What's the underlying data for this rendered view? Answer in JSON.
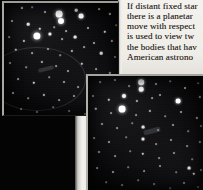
{
  "page": {
    "width": 203,
    "height": 190,
    "background_color": "#000000",
    "paper_color": "#f2f0ec",
    "ink_color": "#2b2722"
  },
  "body_text": {
    "lines": [
      "If distant fixed star",
      "there is a planetar",
      "move with respect",
      "is used to view tw",
      "the bodies that hav",
      "American astrono"
    ],
    "line_1": "If distant fixed star",
    "line_2": "there is a planetar",
    "line_3": "move with respect",
    "line_4": "is used to view tw",
    "line_5": "the bodies that hav",
    "line_6": "American astrono"
  },
  "figures": {
    "top_photo": {
      "name": "star-field-photograph-upper",
      "caption": "",
      "border_color": "#a9a7a2",
      "sky_color": "#050506",
      "star_color": "#ffffff",
      "stars": [
        {
          "x": 18,
          "y": 5,
          "r": 1.1,
          "b": 0.8
        },
        {
          "x": 28,
          "y": 4,
          "r": 0.8,
          "b": 0.55
        },
        {
          "x": 41,
          "y": 9,
          "r": 1.0,
          "b": 0.7
        },
        {
          "x": 55,
          "y": 11,
          "r": 3.4,
          "b": 1.0
        },
        {
          "x": 57,
          "y": 18,
          "r": 3.0,
          "b": 1.0
        },
        {
          "x": 72,
          "y": 7,
          "r": 1.3,
          "b": 0.85
        },
        {
          "x": 77,
          "y": 13,
          "r": 2.4,
          "b": 1.0
        },
        {
          "x": 95,
          "y": 6,
          "r": 0.9,
          "b": 0.6
        },
        {
          "x": 106,
          "y": 11,
          "r": 1.1,
          "b": 0.7
        },
        {
          "x": 8,
          "y": 18,
          "r": 1.0,
          "b": 0.65
        },
        {
          "x": 24,
          "y": 21,
          "r": 1.3,
          "b": 0.85
        },
        {
          "x": 36,
          "y": 26,
          "r": 1.2,
          "b": 0.78
        },
        {
          "x": 50,
          "y": 24,
          "r": 0.8,
          "b": 0.5
        },
        {
          "x": 62,
          "y": 28,
          "r": 0.9,
          "b": 0.58
        },
        {
          "x": 84,
          "y": 25,
          "r": 1.0,
          "b": 0.62
        },
        {
          "x": 101,
          "y": 29,
          "r": 1.2,
          "b": 0.75
        },
        {
          "x": 112,
          "y": 22,
          "r": 0.8,
          "b": 0.5
        },
        {
          "x": 5,
          "y": 34,
          "r": 0.9,
          "b": 0.55
        },
        {
          "x": 20,
          "y": 38,
          "r": 1.1,
          "b": 0.7
        },
        {
          "x": 33,
          "y": 33,
          "r": 3.6,
          "b": 1.0
        },
        {
          "x": 46,
          "y": 31,
          "r": 1.6,
          "b": 0.92
        },
        {
          "x": 58,
          "y": 36,
          "r": 0.9,
          "b": 0.58
        },
        {
          "x": 71,
          "y": 34,
          "r": 1.4,
          "b": 0.88
        },
        {
          "x": 90,
          "y": 40,
          "r": 1.0,
          "b": 0.62
        },
        {
          "x": 108,
          "y": 38,
          "r": 1.1,
          "b": 0.68
        },
        {
          "x": 12,
          "y": 47,
          "r": 1.2,
          "b": 0.72
        },
        {
          "x": 28,
          "y": 50,
          "r": 0.9,
          "b": 0.55
        },
        {
          "x": 44,
          "y": 46,
          "r": 1.0,
          "b": 0.62
        },
        {
          "x": 56,
          "y": 52,
          "r": 0.8,
          "b": 0.48
        },
        {
          "x": 68,
          "y": 48,
          "r": 1.1,
          "b": 0.68
        },
        {
          "x": 80,
          "y": 44,
          "r": 0.9,
          "b": 0.55
        },
        {
          "x": 97,
          "y": 50,
          "r": 1.3,
          "b": 0.8
        },
        {
          "x": 111,
          "y": 54,
          "r": 1.0,
          "b": 0.6
        },
        {
          "x": 6,
          "y": 60,
          "r": 1.0,
          "b": 0.6
        },
        {
          "x": 22,
          "y": 64,
          "r": 0.8,
          "b": 0.48
        },
        {
          "x": 38,
          "y": 59,
          "r": 1.1,
          "b": 0.66
        },
        {
          "x": 52,
          "y": 63,
          "r": 0.9,
          "b": 0.52
        },
        {
          "x": 64,
          "y": 68,
          "r": 1.0,
          "b": 0.6
        },
        {
          "x": 78,
          "y": 61,
          "r": 1.2,
          "b": 0.74
        },
        {
          "x": 92,
          "y": 66,
          "r": 0.9,
          "b": 0.54
        },
        {
          "x": 106,
          "y": 70,
          "r": 1.1,
          "b": 0.66
        },
        {
          "x": 14,
          "y": 76,
          "r": 0.9,
          "b": 0.52
        },
        {
          "x": 30,
          "y": 80,
          "r": 1.2,
          "b": 0.76
        },
        {
          "x": 45,
          "y": 74,
          "r": 0.8,
          "b": 0.46
        },
        {
          "x": 60,
          "y": 79,
          "r": 1.0,
          "b": 0.6
        },
        {
          "x": 74,
          "y": 84,
          "r": 0.9,
          "b": 0.52
        },
        {
          "x": 88,
          "y": 77,
          "r": 1.1,
          "b": 0.66
        },
        {
          "x": 102,
          "y": 82,
          "r": 0.9,
          "b": 0.52
        },
        {
          "x": 113,
          "y": 88,
          "r": 1.0,
          "b": 0.58
        },
        {
          "x": 9,
          "y": 90,
          "r": 1.0,
          "b": 0.58
        },
        {
          "x": 24,
          "y": 95,
          "r": 0.8,
          "b": 0.46
        },
        {
          "x": 40,
          "y": 92,
          "r": 1.1,
          "b": 0.68
        },
        {
          "x": 55,
          "y": 97,
          "r": 0.9,
          "b": 0.52
        },
        {
          "x": 70,
          "y": 93,
          "r": 1.0,
          "b": 0.58
        },
        {
          "x": 86,
          "y": 99,
          "r": 0.8,
          "b": 0.46
        },
        {
          "x": 99,
          "y": 94,
          "r": 1.0,
          "b": 0.58
        },
        {
          "x": 110,
          "y": 101,
          "r": 0.9,
          "b": 0.5
        },
        {
          "x": 17,
          "y": 106,
          "r": 0.9,
          "b": 0.5
        },
        {
          "x": 33,
          "y": 109,
          "r": 1.0,
          "b": 0.58
        },
        {
          "x": 49,
          "y": 104,
          "r": 0.8,
          "b": 0.44
        },
        {
          "x": 65,
          "y": 108,
          "r": 0.9,
          "b": 0.5
        },
        {
          "x": 81,
          "y": 111,
          "r": 1.0,
          "b": 0.56
        },
        {
          "x": 95,
          "y": 106,
          "r": 0.8,
          "b": 0.44
        },
        {
          "x": 108,
          "y": 110,
          "r": 0.9,
          "b": 0.5
        }
      ]
    },
    "bottom_photo": {
      "name": "star-field-photograph-lower",
      "caption": "",
      "border_color": "#b2b0ab",
      "sky_color": "#050506",
      "star_color": "#ffffff",
      "stars": [
        {
          "x": 12,
          "y": 6,
          "r": 0.9,
          "b": 0.52
        },
        {
          "x": 27,
          "y": 4,
          "r": 1.0,
          "b": 0.6
        },
        {
          "x": 41,
          "y": 10,
          "r": 0.9,
          "b": 0.5
        },
        {
          "x": 53,
          "y": 6,
          "r": 2.8,
          "b": 1.0
        },
        {
          "x": 53,
          "y": 13,
          "r": 2.3,
          "b": 0.98
        },
        {
          "x": 68,
          "y": 8,
          "r": 1.0,
          "b": 0.58
        },
        {
          "x": 82,
          "y": 5,
          "r": 0.8,
          "b": 0.44
        },
        {
          "x": 97,
          "y": 12,
          "r": 1.0,
          "b": 0.58
        },
        {
          "x": 110,
          "y": 7,
          "r": 0.8,
          "b": 0.44
        },
        {
          "x": 5,
          "y": 20,
          "r": 1.0,
          "b": 0.58
        },
        {
          "x": 21,
          "y": 24,
          "r": 1.2,
          "b": 0.74
        },
        {
          "x": 36,
          "y": 20,
          "r": 2.0,
          "b": 0.95
        },
        {
          "x": 49,
          "y": 25,
          "r": 1.1,
          "b": 0.66
        },
        {
          "x": 64,
          "y": 22,
          "r": 0.9,
          "b": 0.5
        },
        {
          "x": 72,
          "y": 19,
          "r": 1.0,
          "b": 0.58
        },
        {
          "x": 90,
          "y": 25,
          "r": 2.4,
          "b": 1.0
        },
        {
          "x": 112,
          "y": 21,
          "r": 1.1,
          "b": 0.66
        },
        {
          "x": 8,
          "y": 33,
          "r": 1.2,
          "b": 0.74
        },
        {
          "x": 23,
          "y": 37,
          "r": 0.9,
          "b": 0.5
        },
        {
          "x": 34,
          "y": 33,
          "r": 3.4,
          "b": 1.0
        },
        {
          "x": 48,
          "y": 39,
          "r": 0.9,
          "b": 0.5
        },
        {
          "x": 62,
          "y": 35,
          "r": 1.1,
          "b": 0.66
        },
        {
          "x": 77,
          "y": 40,
          "r": 0.8,
          "b": 0.44
        },
        {
          "x": 93,
          "y": 36,
          "r": 1.0,
          "b": 0.58
        },
        {
          "x": 109,
          "y": 42,
          "r": 1.1,
          "b": 0.64
        },
        {
          "x": 14,
          "y": 48,
          "r": 1.0,
          "b": 0.58
        },
        {
          "x": 29,
          "y": 52,
          "r": 0.9,
          "b": 0.5
        },
        {
          "x": 44,
          "y": 47,
          "r": 0.8,
          "b": 0.42
        },
        {
          "x": 55,
          "y": 51,
          "r": 1.4,
          "b": 0.86
        },
        {
          "x": 70,
          "y": 54,
          "r": 0.9,
          "b": 0.5
        },
        {
          "x": 85,
          "y": 49,
          "r": 1.0,
          "b": 0.58
        },
        {
          "x": 100,
          "y": 55,
          "r": 0.8,
          "b": 0.42
        },
        {
          "x": 113,
          "y": 50,
          "r": 1.0,
          "b": 0.56
        },
        {
          "x": 6,
          "y": 62,
          "r": 0.9,
          "b": 0.5
        },
        {
          "x": 21,
          "y": 66,
          "r": 1.0,
          "b": 0.58
        },
        {
          "x": 38,
          "y": 61,
          "r": 0.8,
          "b": 0.42
        },
        {
          "x": 55,
          "y": 63,
          "r": 1.5,
          "b": 0.9
        },
        {
          "x": 68,
          "y": 68,
          "r": 0.9,
          "b": 0.48
        },
        {
          "x": 83,
          "y": 64,
          "r": 1.0,
          "b": 0.56
        },
        {
          "x": 99,
          "y": 70,
          "r": 0.9,
          "b": 0.48
        },
        {
          "x": 112,
          "y": 66,
          "r": 1.1,
          "b": 0.64
        },
        {
          "x": 11,
          "y": 76,
          "r": 1.0,
          "b": 0.56
        },
        {
          "x": 27,
          "y": 80,
          "r": 0.9,
          "b": 0.48
        },
        {
          "x": 42,
          "y": 75,
          "r": 0.8,
          "b": 0.42
        },
        {
          "x": 55,
          "y": 78,
          "r": 1.2,
          "b": 0.74
        },
        {
          "x": 71,
          "y": 82,
          "r": 0.9,
          "b": 0.48
        },
        {
          "x": 86,
          "y": 77,
          "r": 1.0,
          "b": 0.56
        },
        {
          "x": 104,
          "y": 83,
          "r": 0.8,
          "b": 0.42
        },
        {
          "x": 9,
          "y": 92,
          "r": 0.9,
          "b": 0.48
        },
        {
          "x": 25,
          "y": 96,
          "r": 1.0,
          "b": 0.56
        },
        {
          "x": 40,
          "y": 91,
          "r": 0.8,
          "b": 0.4
        },
        {
          "x": 56,
          "y": 95,
          "r": 0.9,
          "b": 0.48
        },
        {
          "x": 72,
          "y": 90,
          "r": 1.0,
          "b": 0.54
        },
        {
          "x": 88,
          "y": 96,
          "r": 0.8,
          "b": 0.4
        },
        {
          "x": 101,
          "y": 92,
          "r": 1.4,
          "b": 0.88
        },
        {
          "x": 106,
          "y": 98,
          "r": 1.2,
          "b": 0.76
        },
        {
          "x": 113,
          "y": 94,
          "r": 1.0,
          "b": 0.58
        },
        {
          "x": 18,
          "y": 106,
          "r": 0.8,
          "b": 0.42
        },
        {
          "x": 34,
          "y": 109,
          "r": 0.9,
          "b": 0.48
        },
        {
          "x": 50,
          "y": 104,
          "r": 0.8,
          "b": 0.4
        },
        {
          "x": 66,
          "y": 108,
          "r": 0.9,
          "b": 0.46
        },
        {
          "x": 82,
          "y": 112,
          "r": 0.8,
          "b": 0.4
        },
        {
          "x": 96,
          "y": 107,
          "r": 1.0,
          "b": 0.54
        },
        {
          "x": 110,
          "y": 111,
          "r": 0.9,
          "b": 0.46
        }
      ]
    }
  }
}
